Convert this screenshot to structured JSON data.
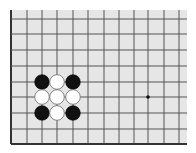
{
  "board": {
    "background": "#e6e6e6",
    "line_color": "#555555",
    "edge_color": "#333333",
    "area": {
      "left": 11,
      "top": 10,
      "right": 187,
      "bottom": 144
    },
    "vertical_lines_x": [
      11,
      27,
      42,
      57,
      73,
      88,
      104,
      119,
      134,
      148,
      164,
      179
    ],
    "horizontal_lines_y": [
      19,
      34,
      50,
      66,
      82,
      97,
      113,
      129,
      144
    ],
    "left_edge": true,
    "bottom_edge": true,
    "star_points": [
      {
        "x": 148,
        "y": 97
      }
    ],
    "stone_radius": 7.3,
    "stones": [
      {
        "color": "black",
        "x": 42,
        "y": 82
      },
      {
        "color": "white",
        "x": 57,
        "y": 82
      },
      {
        "color": "black",
        "x": 73,
        "y": 82
      },
      {
        "color": "white",
        "x": 42,
        "y": 97
      },
      {
        "color": "white",
        "x": 57,
        "y": 97
      },
      {
        "color": "white",
        "x": 73,
        "y": 97
      },
      {
        "color": "black",
        "x": 42,
        "y": 113
      },
      {
        "color": "white",
        "x": 57,
        "y": 113
      },
      {
        "color": "black",
        "x": 73,
        "y": 113
      }
    ]
  }
}
